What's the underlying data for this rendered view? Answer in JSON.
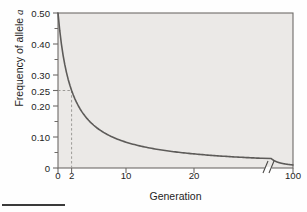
{
  "figure": {
    "background_color": "#fefefe",
    "plot_background_color": "#ebe9e7",
    "axis_color": "#6e6b68",
    "curve_color": "#5d5b59",
    "guide_color": "#9c9a97"
  },
  "chart_data": {
    "type": "line",
    "title": "",
    "xlabel": "Generation",
    "ylabel": "Frequency of allele a",
    "ylabel_plain": "Frequency of allele",
    "ylabel_italic": "a",
    "ylim": [
      0,
      0.5
    ],
    "xlim": [
      0,
      100
    ],
    "grid": false,
    "legend": null,
    "x_axis_broken": true,
    "x_break_label": "//",
    "x_break_at": 30,
    "y_ticks": [
      0,
      0.1,
      0.2,
      0.25,
      0.3,
      0.4,
      0.5
    ],
    "y_tick_labels": [
      "0",
      "0.10",
      "0.20",
      "0.25",
      "0.30",
      "0.40",
      "0.50"
    ],
    "y_minor_ticks": [
      0.05,
      0.15,
      0.35,
      0.45
    ],
    "x_ticks": [
      0,
      2,
      10,
      20,
      100
    ],
    "x_tick_labels": [
      "0",
      "2",
      "10",
      "20",
      "100"
    ],
    "annotations": [
      {
        "name": "guide-to-quarter",
        "style": "dashed",
        "x": 2,
        "y": 0.25,
        "note": "dashed lines mark frequency 0.25 reached at generation 2"
      }
    ],
    "series": [
      {
        "name": "frequency of allele a",
        "formula": "q(t) = 0.5 / (1 + 0.5 t)",
        "x": [
          0,
          1,
          2,
          3,
          4,
          5,
          6,
          8,
          10,
          12,
          14,
          16,
          18,
          20,
          25,
          30,
          40,
          50,
          60,
          80,
          100
        ],
        "values": [
          0.5,
          0.333,
          0.25,
          0.2,
          0.167,
          0.143,
          0.125,
          0.1,
          0.083,
          0.071,
          0.063,
          0.056,
          0.05,
          0.045,
          0.037,
          0.031,
          0.024,
          0.02,
          0.016,
          0.012,
          0.01
        ]
      }
    ]
  },
  "bleed_text": {
    "lines": [
      "the frequency of the allele in each",
      "constant selection against an a",
      "unchanged. It may appear for a gen",
      "be increase that frequency of the reces",
      "original frequency level",
      "In order to understand how a re",
      "if we consider the same recessive allele",
      "mutation at this rate, while a dele",
      "the rare heterozygote carriers can"
    ]
  },
  "page_rule": {
    "present": true
  }
}
